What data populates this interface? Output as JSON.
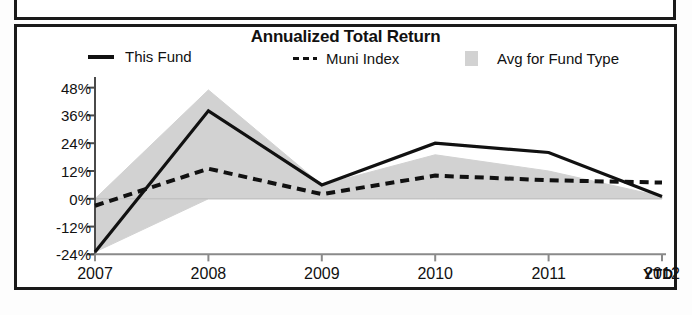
{
  "panel": {
    "above_panel_name": "adjacent-panel-bottom-edge"
  },
  "chart": {
    "title": "Annualized Total Return",
    "ytd_label": "YTD",
    "legend": [
      {
        "label": "This Fund",
        "marker": "solid-line-swatch"
      },
      {
        "label": "Muni Index",
        "marker": "dashed-line-swatch"
      },
      {
        "label": "Avg for Fund Type",
        "marker": "shaded-band-swatch"
      }
    ]
  },
  "chart_data": {
    "type": "line",
    "title": "Annualized Total Return",
    "xlabel": "",
    "ylabel": "",
    "grid": false,
    "legend_position": "top",
    "categories": [
      "2007",
      "2008",
      "2009",
      "2010",
      "2011",
      "2012"
    ],
    "x_tick_labels": [
      "2007",
      "2008",
      "2009",
      "2010",
      "2011",
      "2012"
    ],
    "x_axis_note": "YTD",
    "y_tick_labels": [
      "48%",
      "36%",
      "24%",
      "12%",
      "0%",
      "-12%",
      "-24%"
    ],
    "y_tick_values": [
      48,
      36,
      24,
      12,
      0,
      -12,
      -24
    ],
    "ylim": [
      -26,
      50
    ],
    "series": [
      {
        "name": "This Fund",
        "style": "solid",
        "color": "#111111",
        "values": [
          -23,
          38,
          6,
          24,
          20,
          1
        ]
      },
      {
        "name": "Muni Index",
        "style": "dashed",
        "color": "#111111",
        "values": [
          -3,
          13,
          2,
          10,
          8,
          7
        ]
      }
    ],
    "band": {
      "name": "Avg for Fund Type",
      "style": "shaded-area",
      "color": "#d2d2d2",
      "upper": [
        0,
        47,
        6,
        19,
        12,
        1
      ],
      "lower": [
        -23,
        0,
        0,
        0,
        0,
        0
      ]
    }
  }
}
